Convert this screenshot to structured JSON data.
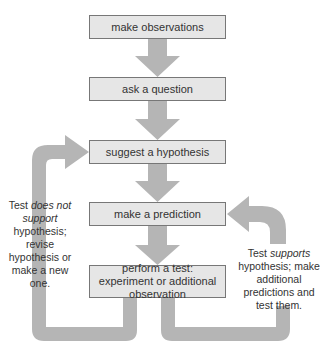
{
  "diagram": {
    "type": "flowchart",
    "title": "",
    "colors": {
      "box_fill": "#e6e6e6",
      "box_border": "#777777",
      "arrow_fill": "#b5b5b5",
      "text": "#333333"
    },
    "steps": [
      {
        "id": "observe",
        "label": "make observations"
      },
      {
        "id": "question",
        "label": "ask a question"
      },
      {
        "id": "hypothesis",
        "label": "suggest a hypothesis"
      },
      {
        "id": "predict",
        "label": "make a prediction"
      },
      {
        "id": "test",
        "label": "perform a test: experiment or additional observation"
      }
    ],
    "edges": [
      {
        "from": "observe",
        "to": "question"
      },
      {
        "from": "question",
        "to": "hypothesis"
      },
      {
        "from": "hypothesis",
        "to": "predict"
      },
      {
        "from": "predict",
        "to": "test"
      },
      {
        "from": "test",
        "to": "hypothesis",
        "label": "Test does not support hypothesis; revise hypothesis or make a new one."
      },
      {
        "from": "test",
        "to": "predict",
        "label": "Test supports hypothesis; make additional predictions and test them."
      }
    ],
    "left_note": {
      "pre": "Test ",
      "em": "does not support",
      "post": " hypothesis; revise hypothesis or make a new one."
    },
    "right_note": {
      "pre": "Test ",
      "em": "supports",
      "post": " hypothesis; make additional predictions and test them."
    }
  }
}
